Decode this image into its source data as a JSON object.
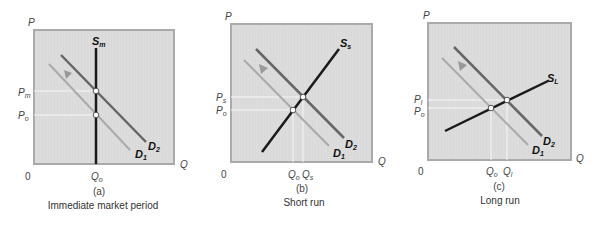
{
  "colors": {
    "frame_fill": "#dcdcdc",
    "frame_border": "#aaaaaa",
    "supply": "#1a1a1a",
    "demand_new": "#666666",
    "demand_old": "#aaaaaa",
    "guide": "#f4f4f4",
    "arrow": "#999999"
  },
  "panels": [
    {
      "id": "a",
      "panel_label": "(a)",
      "caption": "Immediate market period",
      "y_axis": "P",
      "x_axis": "Q",
      "origin": "0",
      "supply_label": "S",
      "supply_sub": "m",
      "d2_label": "D",
      "d2_sub": "2",
      "d1_label": "D",
      "d1_sub": "1",
      "price_labels": [
        {
          "main": "P",
          "sub": "m"
        },
        {
          "main": "P",
          "sub": "o"
        }
      ],
      "quantity_labels": [
        {
          "main": "Q",
          "sub": "o"
        }
      ]
    },
    {
      "id": "b",
      "panel_label": "(b)",
      "caption": "Short run",
      "y_axis": "P",
      "x_axis": "Q",
      "origin": "0",
      "supply_label": "S",
      "supply_sub": "s",
      "d2_label": "D",
      "d2_sub": "2",
      "d1_label": "D",
      "d1_sub": "1",
      "price_labels": [
        {
          "main": "P",
          "sub": "s"
        },
        {
          "main": "P",
          "sub": "o"
        }
      ],
      "quantity_labels": [
        {
          "main": "Q",
          "sub": "o"
        },
        {
          "main": "Q",
          "sub": "s"
        }
      ]
    },
    {
      "id": "c",
      "panel_label": "(c)",
      "caption": "Long run",
      "y_axis": "P",
      "x_axis": "Q",
      "origin": "0",
      "supply_label": "S",
      "supply_sub": "L",
      "d2_label": "D",
      "d2_sub": "2",
      "d1_label": "D",
      "d1_sub": "1",
      "price_labels": [
        {
          "main": "P",
          "sub": "l"
        },
        {
          "main": "P",
          "sub": "o"
        }
      ],
      "quantity_labels": [
        {
          "main": "Q",
          "sub": "o"
        },
        {
          "main": "Q",
          "sub": "l"
        }
      ]
    }
  ]
}
